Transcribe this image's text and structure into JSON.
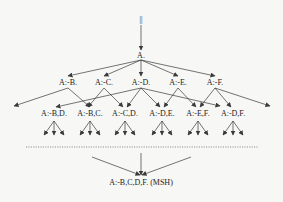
{
  "diagram": {
    "root": "||",
    "top": "A.",
    "level1": [
      "A:-B.",
      "A:-C.",
      "A:-D.",
      "A:-E.",
      "A:-F."
    ],
    "level2": [
      "A:-B,D.",
      "A:-B,C.",
      "A:-C,D.",
      "A:-D,E.",
      "A:-E,F.",
      "A:-D,F."
    ],
    "bottom": "A:-B,C,D,F. (MSH)",
    "colors": {
      "line": "#3a3a3a",
      "text": "#222222",
      "background": "#f7f7f5"
    }
  }
}
